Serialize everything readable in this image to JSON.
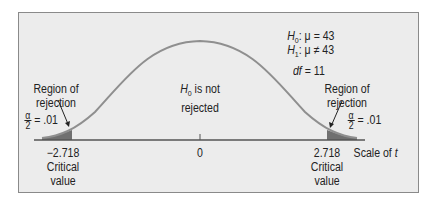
{
  "diagram": {
    "type": "t-distribution two-tailed test",
    "hypotheses": {
      "h0": {
        "sym": "H",
        "sub": "0",
        "text": ": μ = 43"
      },
      "h1": {
        "sym": "H",
        "sub": "1",
        "text": ": μ ≠ 43"
      }
    },
    "df": {
      "sym": "df",
      "text": " = 11"
    },
    "left_region": {
      "line1": "Region of",
      "line2": "rejection"
    },
    "right_region": {
      "line1": "Region of",
      "line2": "rejection"
    },
    "center_label": {
      "sym": "H",
      "sub": "0",
      "line1_rest": " is not",
      "line2": "rejected"
    },
    "alpha_half": {
      "num": "α",
      "den": "2",
      "rest": " = .01"
    },
    "ticks": {
      "left": {
        "value": "−2.718",
        "line2": "Critical",
        "line3": "value"
      },
      "center": {
        "value": "0"
      },
      "right": {
        "value": "2.718",
        "line2": "Critical",
        "line3": "value"
      }
    },
    "axis_label": {
      "text": "Scale of ",
      "var": "t"
    },
    "colors": {
      "curve": "#8f8f8f",
      "shade": "#707070",
      "panel": "#ececec",
      "border": "#8a8a8a"
    }
  }
}
